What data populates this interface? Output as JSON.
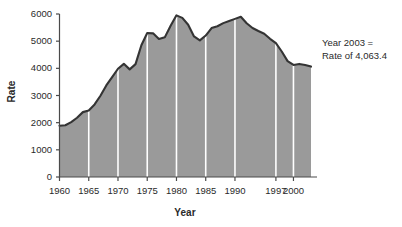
{
  "chart_data": {
    "type": "area",
    "title": "",
    "subtitle": "",
    "xlabel": "Year",
    "ylabel": "Rate",
    "xlim": [
      1960,
      2003
    ],
    "ylim": [
      0,
      6000
    ],
    "grid": "vertical-white-5yr",
    "legend": "none",
    "series_name": "Rate",
    "x": [
      1960,
      1961,
      1962,
      1963,
      1964,
      1965,
      1966,
      1967,
      1968,
      1969,
      1970,
      1971,
      1972,
      1973,
      1974,
      1975,
      1976,
      1977,
      1978,
      1979,
      1980,
      1981,
      1982,
      1983,
      1984,
      1985,
      1986,
      1987,
      1988,
      1989,
      1990,
      1991,
      1992,
      1993,
      1994,
      1995,
      1996,
      1997,
      1998,
      1999,
      2000,
      2001,
      2002,
      2003
    ],
    "values": [
      1887.2,
      1906.1,
      2019.8,
      2180.3,
      2388.1,
      2449.0,
      2670.8,
      2989.7,
      3370.2,
      3680.0,
      3984.5,
      4164.7,
      3961.4,
      4154.4,
      4850.4,
      5298.5,
      5287.3,
      5077.6,
      5140.3,
      5565.5,
      5950.0,
      5858.2,
      5603.6,
      5175.0,
      5031.3,
      5207.1,
      5480.4,
      5550.0,
      5664.2,
      5741.0,
      5820.3,
      5897.8,
      5660.2,
      5484.4,
      5373.5,
      5275.9,
      5086.6,
      4930.0,
      4620.1,
      4266.5,
      4124.8,
      4162.6,
      4125.0,
      4063.4
    ],
    "ytick_labels": [
      "0",
      "1000",
      "2000",
      "3000",
      "4000",
      "5000",
      "6000"
    ],
    "ytick_values": [
      0,
      1000,
      2000,
      3000,
      4000,
      5000,
      6000
    ],
    "xtick_labels": [
      "1960",
      "1965",
      "1970",
      "1975",
      "1980",
      "1985",
      "1990",
      "1997",
      "2000"
    ],
    "xtick_values": [
      1960,
      1965,
      1970,
      1975,
      1980,
      1985,
      1990,
      1997,
      2000
    ],
    "gridline_years": [
      1965,
      1970,
      1975,
      1980,
      1985,
      1990,
      1997,
      2000
    ],
    "annotation": {
      "line1": "Year 2003 =",
      "line2": "Rate of 4,063.4"
    },
    "colors": {
      "fill": "#9a9a9a",
      "line": "#343434",
      "gridline": "#ffffff",
      "axis": "#4a4a4a",
      "text": "#2a2a2a",
      "background": "#ffffff"
    }
  }
}
